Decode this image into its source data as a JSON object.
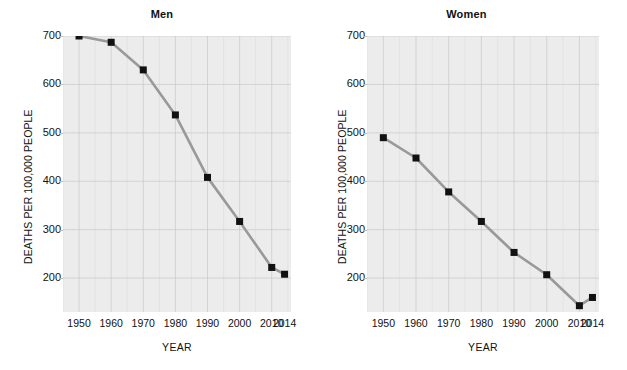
{
  "figure": {
    "background_color": "#ffffff",
    "plot_background_color": "#ececec",
    "line_color": "#999999",
    "marker_color": "#111111",
    "gridline_color": "#c9c9c9"
  },
  "chart_data": [
    {
      "type": "line",
      "title": "Men",
      "xlabel": "YEAR",
      "ylabel": "DEATHS PER 100,000 PEOPLE",
      "categories": [
        "1950",
        "1960",
        "1970",
        "1980",
        "1990",
        "2000",
        "2010",
        "2014"
      ],
      "x": [
        1950,
        1960,
        1970,
        1980,
        1990,
        2000,
        2010,
        2014
      ],
      "values": [
        700,
        687,
        630,
        537,
        408,
        317,
        222,
        208
      ],
      "xlim": [
        1945,
        2016
      ],
      "ylim": [
        130,
        700
      ],
      "yticks": [
        200,
        300,
        400,
        500,
        600,
        700
      ],
      "ytick_labels": [
        "200",
        "300",
        "400",
        "500",
        "600",
        "700"
      ],
      "xtick_labels": [
        "1950",
        "1960",
        "1970",
        "1980",
        "1990",
        "2000",
        "2010",
        "2014"
      ],
      "grid": true,
      "legend": "none",
      "marker": "square"
    },
    {
      "type": "line",
      "title": "Women",
      "xlabel": "YEAR",
      "ylabel": "DEATHS PER 100,000 PEOPLE",
      "categories": [
        "1950",
        "1960",
        "1970",
        "1980",
        "1990",
        "2000",
        "2010",
        "2014"
      ],
      "x": [
        1950,
        1960,
        1970,
        1980,
        1990,
        2000,
        2010,
        2014
      ],
      "values": [
        490,
        448,
        378,
        317,
        253,
        207,
        143,
        160
      ],
      "xlim": [
        1945,
        2016
      ],
      "ylim": [
        130,
        700
      ],
      "yticks": [
        200,
        300,
        400,
        500,
        600,
        700
      ],
      "ytick_labels": [
        "200",
        "300",
        "400",
        "500",
        "600",
        "700"
      ],
      "xtick_labels": [
        "1950",
        "1960",
        "1970",
        "1980",
        "1990",
        "2000",
        "2010",
        "2014"
      ],
      "grid": true,
      "legend": "none",
      "marker": "square"
    }
  ]
}
